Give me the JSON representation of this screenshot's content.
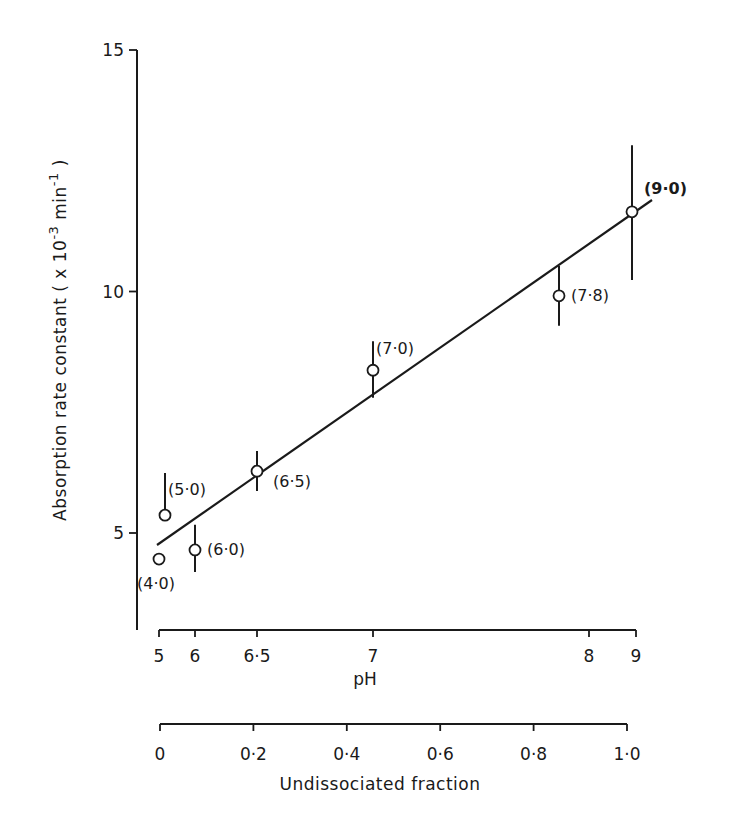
{
  "chart_data": {
    "type": "scatter",
    "title": "",
    "ylabel": "Absorption rate constant (x 10^-3 min^-1)",
    "ylabel_main": "Absorption rate constant ( x 10",
    "ylabel_exp": "-3",
    "ylabel_unit": " min",
    "ylabel_unit_exp": "-1",
    "ylabel_close": " )",
    "ylim": [
      3,
      15
    ],
    "yticks": [
      5,
      10,
      15
    ],
    "xlabel": "pH",
    "xticks_pH": [
      {
        "label": "5",
        "frac": 0.0
      },
      {
        "label": "6",
        "frac": 0.075
      },
      {
        "label": "6·5",
        "frac": 0.21
      },
      {
        "label": "7",
        "frac": 0.46
      },
      {
        "label": "8",
        "frac": 0.92
      },
      {
        "label": "9",
        "frac": 1.02
      }
    ],
    "xlabel2": "Undissociated fraction",
    "xticks_fraction": [
      "0",
      "0·2",
      "0·4",
      "0·6",
      "0·8",
      "1·0"
    ],
    "xlim": [
      0,
      1.0
    ],
    "grid": false,
    "legend": null,
    "points": [
      {
        "label": "(4·0)",
        "x": 0.0,
        "y": 4.46,
        "err_low": null,
        "err_high": null
      },
      {
        "label": "(5·0)",
        "x": 0.01,
        "y": 5.37,
        "err_low": null,
        "err_high": 6.24
      },
      {
        "label": "(6·0)",
        "x": 0.07,
        "y": 4.65,
        "err_low": 4.19,
        "err_high": 5.17
      },
      {
        "label": "(6·5)",
        "x": 0.21,
        "y": 6.28,
        "err_low": 5.87,
        "err_high": 6.7
      },
      {
        "label": "(7·0)",
        "x": 0.46,
        "y": 8.37,
        "err_low": 7.8,
        "err_high": 8.97
      },
      {
        "label": "(7·8)",
        "x": 0.85,
        "y": 9.91,
        "err_low": 9.29,
        "err_high": 10.53
      },
      {
        "label": "(9·0)",
        "x": 1.0,
        "y": 11.65,
        "err_low": 10.24,
        "err_high": 13.03
      }
    ],
    "fit_line": {
      "x": [
        -0.01,
        1.05
      ],
      "y": [
        4.77,
        12.0
      ]
    },
    "annotations": "Numbers in parentheses are pH values of each data point"
  }
}
